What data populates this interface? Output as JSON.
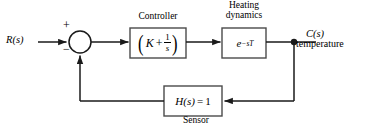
{
  "diagram": {
    "type": "control-system-block-diagram",
    "colors": {
      "background": "#ffffff",
      "stroke": "#1a1a1a",
      "text": "#000000"
    },
    "signals": {
      "input": {
        "label": "R(s)",
        "name": "reference-input"
      },
      "output": {
        "label": "C(s)",
        "sublabel": "temperature",
        "name": "controlled-output"
      }
    },
    "summing_junction": {
      "name": "summing-junction",
      "plus_sign": "+",
      "minus_sign": "−",
      "center": {
        "x": 80,
        "y": 42
      },
      "radius": 11
    },
    "blocks": [
      {
        "id": "controller",
        "caption": "Controller",
        "expression_parts": {
          "open_paren": "(",
          "gain": "K",
          "operator": "+",
          "numerator": "1",
          "denominator": "s",
          "close_paren": ")"
        },
        "expression_text": "(K + 1/s)",
        "rect": {
          "x": 130,
          "y": 28,
          "w": 56,
          "h": 30
        }
      },
      {
        "id": "plant",
        "caption_line1": "Heating",
        "caption_line2": "dynamics",
        "expression_base": "e",
        "expression_exponent": "−sT",
        "expression_text": "e^(-sT)",
        "rect": {
          "x": 222,
          "y": 28,
          "w": 44,
          "h": 30
        }
      },
      {
        "id": "sensor",
        "caption": "Sensor",
        "expression_fn": "H(s)",
        "expression_eq": "=",
        "expression_value": "1",
        "expression_text": "H(s) = 1",
        "rect": {
          "x": 164,
          "y": 86,
          "w": 58,
          "h": 30
        }
      }
    ],
    "nodes": {
      "takeoff": {
        "name": "takeoff-node",
        "x": 294,
        "y": 42,
        "r": 3
      }
    },
    "paths": {
      "forward_main_y": 42,
      "feedback_y": 101
    }
  }
}
